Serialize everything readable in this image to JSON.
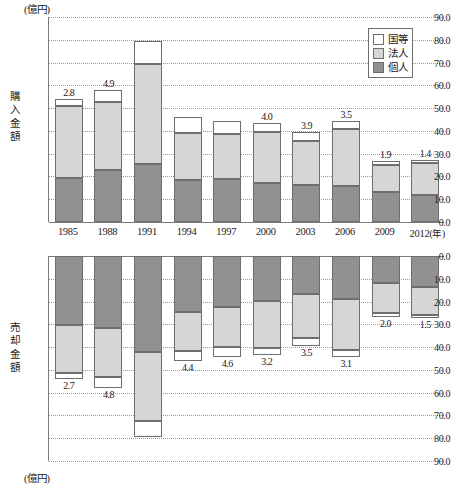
{
  "axis": {
    "unit_top": "(億円)",
    "unit_bottom": "(億円)",
    "ylabel_top": "購入金額",
    "ylabel_bottom": "売却金額",
    "year_suffix": "(年)",
    "ticks_top": [
      "90.0",
      "80.0",
      "70.0",
      "60.0",
      "50.0",
      "40.0",
      "30.0",
      "20.0",
      "10.0",
      "0.0"
    ],
    "ticks_bottom": [
      "0.0",
      "10.0",
      "20.0",
      "30.0",
      "40.0",
      "50.0",
      "60.0",
      "70.0",
      "80.0",
      "90.0"
    ]
  },
  "legend": {
    "items": [
      {
        "label": "国等",
        "color": "#ffffff"
      },
      {
        "label": "法人",
        "color": "#d6d6d6"
      },
      {
        "label": "個人",
        "color": "#919191"
      }
    ]
  },
  "chart_data": [
    {
      "type": "bar",
      "title": "購入金額",
      "subtitle": "",
      "xlabel": "(年)",
      "ylabel": "購入金額",
      "unit": "億円",
      "ylim": [
        0,
        90
      ],
      "yticks": [
        0,
        10,
        20,
        30,
        40,
        50,
        60,
        70,
        80,
        90
      ],
      "grid": true,
      "stacked": true,
      "direction": "up",
      "legend_position": "top-right",
      "categories": [
        "1985",
        "1988",
        "1991",
        "1994",
        "1997",
        "2000",
        "2003",
        "2006",
        "2009",
        "2012"
      ],
      "series": [
        {
          "name": "個人",
          "color": "#919191",
          "values": [
            19.3,
            22.8,
            25.4,
            18.6,
            18.8,
            17.1,
            16.4,
            15.8,
            13.0,
            11.9
          ]
        },
        {
          "name": "法人",
          "color": "#d6d6d6",
          "values": [
            31.8,
            30.1,
            43.8,
            20.5,
            19.8,
            22.4,
            19.2,
            24.9,
            12.0,
            14.1
          ]
        },
        {
          "name": "国等",
          "color": "#ffffff",
          "values": [
            2.8,
            4.9,
            10.4,
            7.0,
            5.9,
            4.0,
            3.9,
            3.5,
            1.9,
            1.4
          ]
        }
      ]
    },
    {
      "type": "bar",
      "title": "売却金額",
      "subtitle": "",
      "xlabel": "(年)",
      "ylabel": "売却金額",
      "unit": "億円",
      "ylim": [
        0,
        90
      ],
      "yticks": [
        0,
        10,
        20,
        30,
        40,
        50,
        60,
        70,
        80,
        90
      ],
      "grid": true,
      "stacked": true,
      "direction": "down",
      "legend_position": "none",
      "categories": [
        "1985",
        "1988",
        "1991",
        "1994",
        "1997",
        "2000",
        "2003",
        "2006",
        "2009",
        "2012"
      ],
      "series": [
        {
          "name": "個人",
          "color": "#919191",
          "values": [
            30.3,
            31.8,
            42.1,
            24.5,
            22.4,
            19.8,
            16.5,
            18.9,
            12.0,
            13.5
          ]
        },
        {
          "name": "法人",
          "color": "#d6d6d6",
          "values": [
            20.9,
            21.2,
            30.4,
            17.2,
            17.5,
            20.5,
            19.5,
            22.2,
            12.9,
            12.4
          ]
        },
        {
          "name": "国等",
          "color": "#ffffff",
          "values": [
            2.7,
            4.8,
            7.1,
            4.4,
            4.6,
            3.2,
            3.5,
            3.1,
            2.0,
            1.5
          ]
        }
      ]
    }
  ]
}
